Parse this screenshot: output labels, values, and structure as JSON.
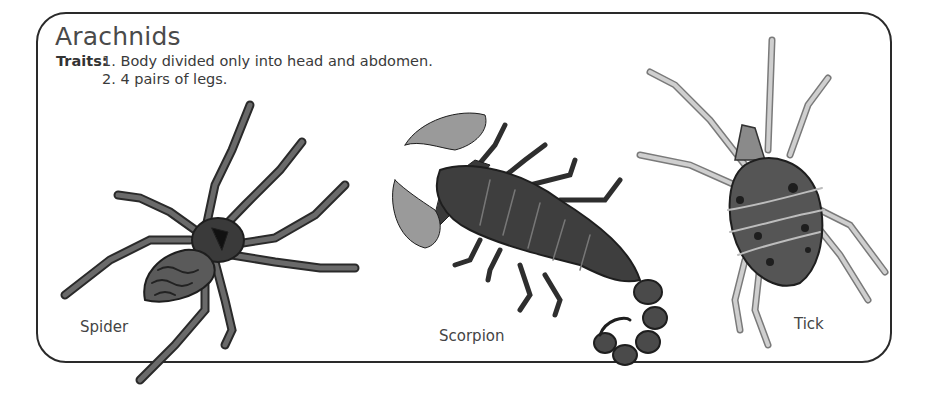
{
  "worksheet": {
    "title": "Arachnids",
    "traits_label": "Traits:",
    "traits": [
      "1. Body divided only into head and abdomen.",
      "2. 4 pairs of legs."
    ],
    "illustrations": [
      {
        "name": "spider",
        "caption": "Spider"
      },
      {
        "name": "scorpion",
        "caption": "Scorpion"
      },
      {
        "name": "tick",
        "caption": "Tick"
      }
    ]
  },
  "colors": {
    "border": "#2a2a2a",
    "text": "#3a3a3a",
    "spider_body": "#4a4a4a",
    "scorpion_body": "#3e3e3e",
    "scorpion_claws": "#9a9a9a",
    "tick_legs": "#b5b5b5",
    "tick_body": "#555555"
  }
}
